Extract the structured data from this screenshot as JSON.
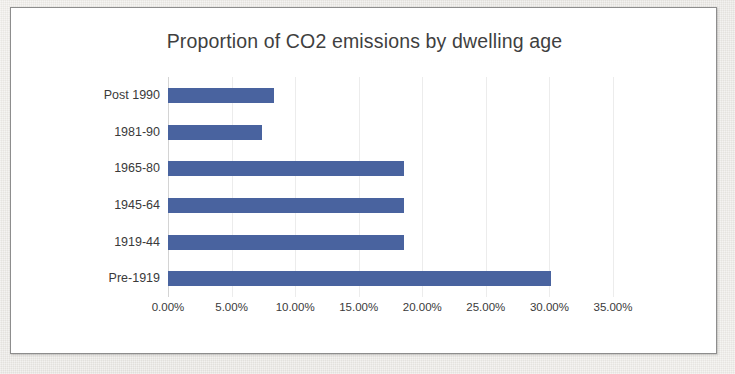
{
  "frame": {
    "border_color": "#8d8d8d",
    "background": "#ffffff"
  },
  "chart_data": {
    "type": "bar",
    "orientation": "horizontal",
    "title": "Proportion of CO2 emissions by dwelling age",
    "xlabel": "",
    "ylabel": "",
    "categories": [
      "Post 1990",
      "1981-90",
      "1965-80",
      "1945-64",
      "1919-44",
      "Pre-1919"
    ],
    "values": [
      8.3,
      7.4,
      18.6,
      18.6,
      18.6,
      30.1
    ],
    "value_format": "percent",
    "xlim": [
      0,
      35
    ],
    "xticks": [
      0,
      5,
      10,
      15,
      20,
      25,
      30,
      35
    ],
    "xtick_labels": [
      "0.00%",
      "5.00%",
      "10.00%",
      "15.00%",
      "20.00%",
      "25.00%",
      "30.00%",
      "35.00%"
    ],
    "grid": "vertical",
    "legend": "none",
    "series": [
      {
        "name": "Proportion of CO2 emissions",
        "color": "#49639f",
        "values": [
          8.3,
          7.4,
          18.6,
          18.6,
          18.6,
          30.1
        ]
      }
    ],
    "category_order_top_to_bottom": [
      "Post 1990",
      "1981-90",
      "1965-80",
      "1945-64",
      "1919-44",
      "Pre-1919"
    ],
    "bar_color": "#49639f",
    "gridline_color": "#ececec",
    "text_color": "#3a3a3a"
  }
}
